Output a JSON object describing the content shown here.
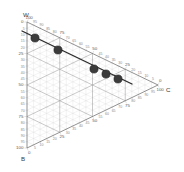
{
  "figure": {
    "type": "ternary-diagram",
    "background_color": "#ffffff"
  },
  "vertices": {
    "top": {
      "label": "W",
      "name": "vertex-label-w"
    },
    "right": {
      "label": "C",
      "name": "vertex-label-c"
    },
    "bottom_left": {
      "label": "B",
      "name": "vertex-label-b"
    }
  },
  "axes": {
    "left": {
      "vertex_from": "W",
      "vertex_to": "B",
      "major_ticks": [
        "25",
        "50",
        "75"
      ],
      "minor_ticks": [
        "5",
        "10",
        "15",
        "20",
        "30",
        "35",
        "40",
        "45",
        "55",
        "60",
        "65",
        "70",
        "80",
        "85",
        "90",
        "95"
      ],
      "end_labels": [
        "0",
        "100"
      ]
    },
    "top_right": {
      "vertex_from": "W",
      "vertex_to": "C",
      "major_ticks": [
        "75",
        "50",
        "25"
      ],
      "minor_ticks": [
        "95",
        "90",
        "85",
        "80",
        "70",
        "65",
        "60",
        "55",
        "45",
        "40",
        "35",
        "30",
        "20",
        "15",
        "10",
        "5"
      ],
      "end_labels": [
        "100",
        "0"
      ]
    },
    "bottom": {
      "vertex_from": "B",
      "vertex_to": "C",
      "major_ticks": [
        "25",
        "50",
        "75"
      ],
      "minor_ticks": [
        "5",
        "10",
        "15",
        "20",
        "30",
        "35",
        "40",
        "45",
        "55",
        "60",
        "65",
        "70",
        "80",
        "85",
        "90",
        "95"
      ],
      "end_labels": [
        "0",
        "100"
      ]
    }
  },
  "colors": {
    "grid_minor": "#cfcfcf",
    "grid_major": "#9a9a9a",
    "triangle_outline": "#6e6e6e",
    "trend_line": "#2b2b2b",
    "marker_fill": "#3b3b3b",
    "marker_stroke": "#1a1a1a",
    "tick_text": "#8a8a8a",
    "label_text": "#3a3a3a"
  },
  "chart_data": {
    "type": "scatter",
    "title": "",
    "subtitle": "",
    "xlabel": "",
    "ylabel": "",
    "axis_names": [
      "W",
      "C",
      "B"
    ],
    "axis_ranges": [
      [
        0,
        100
      ],
      [
        0,
        100
      ],
      [
        0,
        100
      ]
    ],
    "grid": true,
    "legend": false,
    "legend_position": "none",
    "tick_interval": 5,
    "major_tick_interval": 25,
    "series": [
      {
        "name": "trend",
        "kind": "line-with-markers",
        "line_color": "#2b2b2b",
        "marker_color": "#3b3b3b",
        "points": [
          {
            "index": 1,
            "px": 35,
            "py": 38,
            "W": 86,
            "C": 9,
            "B": 5
          },
          {
            "index": 2,
            "px": 58,
            "py": 50,
            "W": 75,
            "C": 20,
            "B": 5
          },
          {
            "index": 3,
            "px": 94,
            "py": 69,
            "W": 57,
            "C": 38,
            "B": 5
          },
          {
            "index": 4,
            "px": 106,
            "py": 74,
            "W": 51,
            "C": 44,
            "B": 5
          },
          {
            "index": 5,
            "px": 118,
            "py": 79,
            "W": 45,
            "C": 50,
            "B": 5
          }
        ],
        "line_start": {
          "px": 22,
          "py": 31
        },
        "line_end": {
          "px": 132,
          "py": 84
        }
      }
    ]
  }
}
